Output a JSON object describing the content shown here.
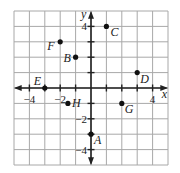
{
  "figure": {
    "type": "coordinate-plane",
    "grid": {
      "xmin": -5,
      "xmax": 5,
      "ymin": -5,
      "ymax": 5,
      "step": 1
    },
    "axes": {
      "x_label": "x",
      "y_label": "y"
    },
    "tick_labels": {
      "x": [
        {
          "value": -4,
          "text": "−4"
        },
        {
          "value": -2,
          "text": "−2"
        },
        {
          "value": 4,
          "text": "4"
        }
      ],
      "y": [
        {
          "value": 4,
          "text": "4"
        },
        {
          "value": -2,
          "text": "−2"
        },
        {
          "value": -4,
          "text": "−4"
        }
      ]
    },
    "points": [
      {
        "name": "A",
        "x": 0,
        "y": -3
      },
      {
        "name": "B",
        "x": -1,
        "y": 2
      },
      {
        "name": "C",
        "x": 1,
        "y": 4
      },
      {
        "name": "D",
        "x": 3,
        "y": 1
      },
      {
        "name": "E",
        "x": -3,
        "y": 0
      },
      {
        "name": "F",
        "x": -2,
        "y": 3
      },
      {
        "name": "G",
        "x": 2,
        "y": -1
      },
      {
        "name": "H",
        "x": -1.5,
        "y": -1
      }
    ],
    "colors": {
      "grid": "#a8a8a8",
      "ink": "#222222",
      "background": "#ffffff"
    }
  }
}
